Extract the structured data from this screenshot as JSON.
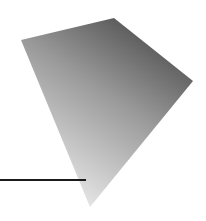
{
  "figure": {
    "shape": "quadrilateral",
    "vertices": {
      "left": [
        21,
        40
      ],
      "top": [
        114,
        18
      ],
      "right": [
        193,
        81
      ],
      "bottom": [
        90,
        207
      ]
    },
    "gradient": {
      "light": "#e4e4e4",
      "mid": "#9a9a9a",
      "dark": "#4f4f4f"
    },
    "line": {
      "x1": 0,
      "y1": 180,
      "x2": 86,
      "y2": 180,
      "color": "#1a1a1a",
      "width": 2
    }
  }
}
